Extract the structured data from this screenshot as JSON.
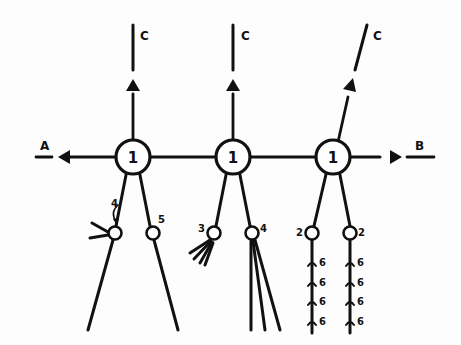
{
  "diagram": {
    "stroke_color": "#111111",
    "background": "#fdfdfd",
    "outputs": {
      "left": "A",
      "right": "B",
      "top": [
        "C",
        "C",
        "C"
      ]
    },
    "main_nodes": [
      {
        "label": "1",
        "cx": 133,
        "cy": 157
      },
      {
        "label": "1",
        "cx": 233,
        "cy": 157
      },
      {
        "label": "1",
        "cx": 333,
        "cy": 157
      }
    ],
    "sub_nodes": [
      {
        "label": "4",
        "parent": 0,
        "note": "ending with two short branches"
      },
      {
        "label": "5",
        "parent": 0
      },
      {
        "label": "3",
        "parent": 1,
        "note": "ending with brush of short fibres"
      },
      {
        "label": "4",
        "parent": 1,
        "note": "ending with bundle of long fibres"
      },
      {
        "label": "2",
        "parent": 2
      },
      {
        "label": "2",
        "parent": 2
      }
    ],
    "side_markers": {
      "label": "6",
      "count_per_branch": 4,
      "left_column": [
        "6",
        "6",
        "6",
        "6"
      ],
      "right_column": [
        "6",
        "6",
        "6",
        "6"
      ]
    }
  }
}
